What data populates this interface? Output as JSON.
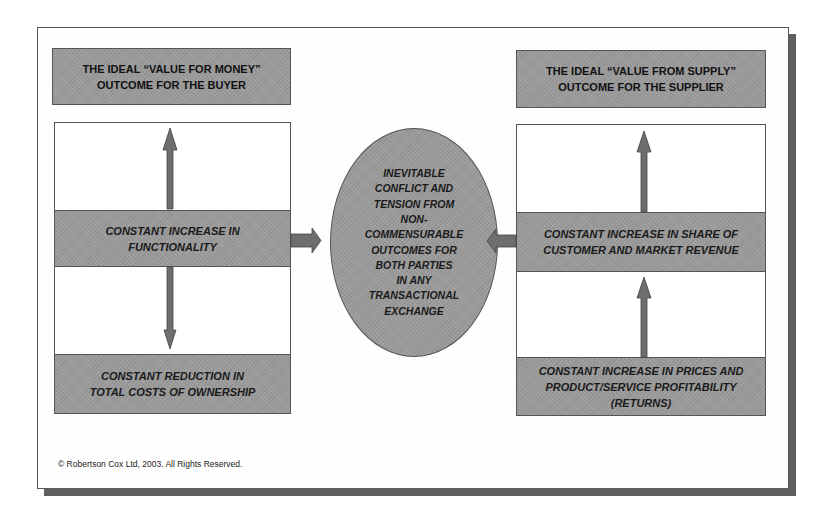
{
  "diagram": {
    "left": {
      "title": "THE IDEAL “VALUE FOR MONEY”\nOUTCOME FOR THE BUYER",
      "middle": "CONSTANT INCREASE IN\nFUNCTIONALITY",
      "bottom": "CONSTANT REDUCTION IN\nTOTAL COSTS OF OWNERSHIP"
    },
    "right": {
      "title": "THE IDEAL “VALUE FROM SUPPLY”\nOUTCOME FOR THE SUPPLIER",
      "middle": "CONSTANT INCREASE IN SHARE OF\nCUSTOMER AND MARKET REVENUE",
      "bottom": "CONSTANT INCREASE IN PRICES AND\nPRODUCT/SERVICE PROFITABILITY\n(RETURNS)"
    },
    "center": {
      "text": "INEVITABLE\nCONFLICT AND\nTENSION FROM\nNON-\nCOMMENSURABLE\nOUTCOMES FOR\nBOTH PARTIES\nIN ANY\nTRANSACTIONAL\nEXCHANGE"
    },
    "arrows": [
      {
        "from": "left-middle",
        "to": "left-title",
        "direction": "up"
      },
      {
        "from": "left-middle",
        "to": "left-bottom",
        "direction": "down"
      },
      {
        "from": "left-middle",
        "to": "center",
        "direction": "right"
      },
      {
        "from": "right-middle",
        "to": "right-title",
        "direction": "up"
      },
      {
        "from": "right-bottom",
        "to": "right-middle",
        "direction": "up"
      },
      {
        "from": "right-middle",
        "to": "center",
        "direction": "left"
      }
    ],
    "colors": {
      "box_fill": "#9a9a9a",
      "arrow_fill": "#6e6e6e",
      "border": "#555555",
      "shadow": "#5f5f5f"
    },
    "copyright": "©  Robertson Cox Ltd, 2003.  All Rights Reserved."
  }
}
